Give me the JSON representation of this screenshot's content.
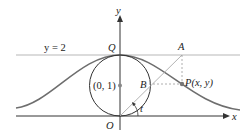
{
  "diagram": {
    "colors": {
      "axes": "#333333",
      "curve": "#6e6e6e",
      "circle": "#333333",
      "line_y2": "#b0b0b0",
      "construction": "#aaaaaa",
      "point": "#777777"
    },
    "labels": {
      "y_axis": "y",
      "x_axis": "x",
      "line": "y = 2",
      "Q": "Q",
      "A": "A",
      "O": "O",
      "B": "B",
      "P": "P(x, y)",
      "center": "(0, 1)",
      "angle": "t"
    }
  }
}
